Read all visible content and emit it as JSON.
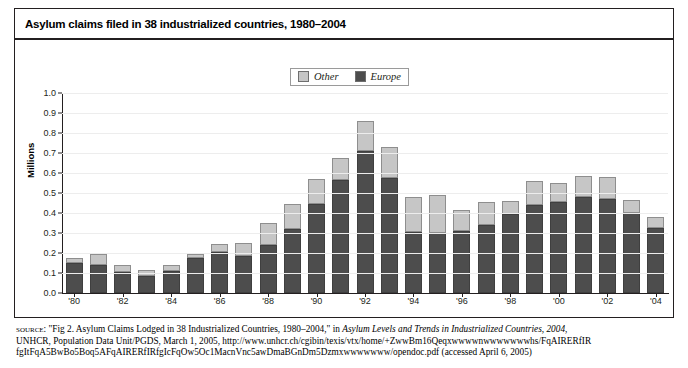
{
  "figure": {
    "title": "Asylum claims filed in 38 industrialized countries, 1980–2004"
  },
  "legend": {
    "position": "top-center",
    "items": [
      {
        "label": "Other",
        "color": "#c6c6c6"
      },
      {
        "label": "Europe",
        "color": "#4d4d4d"
      }
    ]
  },
  "axes": {
    "ylabel": "Millions",
    "yticks": [
      "0.0",
      "0.1",
      "0.2",
      "0.3",
      "0.4",
      "0.5",
      "0.6",
      "0.7",
      "0.8",
      "0.9",
      "1.0"
    ],
    "xticks": [
      "'80",
      "'82",
      "'84",
      "'86",
      "'88",
      "'90",
      "'92",
      "'94",
      "'96",
      "'98",
      "'00",
      "'02",
      "'04"
    ]
  },
  "source": {
    "label": "source:",
    "line1_pre": " \"Fig 2. Asylum Claims Lodged in 38 Industrialized Countries, 1980–2004,\" in ",
    "line1_ital": "Asylum Levels and Trends in Industrialized Countries, 2004",
    "line1_post": ",",
    "line2": "UNHCR, Population Data Unit/PGDS, March 1, 2005, http://www.unhcr.ch/cgibin/texis/vtx/home/+ZwwBm16Qeqxwwwwnwwwwwwwhs/FqAIRERfIR",
    "line3": "fgItFqA5BwBo5Boq5AFqAIRERfIRfgIcFqOw5Oc1MacnVnc5awDmaBGnDm5Dzmxwwwwwww/opendoc.pdf (accessed April 6, 2005)"
  },
  "chart_data": {
    "type": "bar",
    "subtype": "stacked",
    "title": "Asylum claims filed in 38 industrialized countries, 1980–2004",
    "xlabel": "",
    "ylabel": "Millions",
    "ylim": [
      0.0,
      1.0
    ],
    "ystep": 0.1,
    "grid": true,
    "legend_position": "top-center",
    "categories": [
      "1980",
      "1981",
      "1982",
      "1983",
      "1984",
      "1985",
      "1986",
      "1987",
      "1988",
      "1989",
      "1990",
      "1991",
      "1992",
      "1993",
      "1994",
      "1995",
      "1996",
      "1997",
      "1998",
      "1999",
      "2000",
      "2001",
      "2002",
      "2003",
      "2004"
    ],
    "tick_labels": [
      "'80",
      "",
      "'82",
      "",
      "'84",
      "",
      "'86",
      "",
      "'88",
      "",
      "'90",
      "",
      "'92",
      "",
      "'94",
      "",
      "'96",
      "",
      "'98",
      "",
      "'00",
      "",
      "'02",
      "",
      "'04"
    ],
    "series": [
      {
        "name": "Europe",
        "color": "#4d4d4d",
        "values": [
          0.152,
          0.139,
          0.104,
          0.086,
          0.109,
          0.173,
          0.204,
          0.185,
          0.24,
          0.322,
          0.447,
          0.566,
          0.71,
          0.575,
          0.304,
          0.298,
          0.311,
          0.342,
          0.393,
          0.441,
          0.454,
          0.482,
          0.472,
          0.4,
          0.325
        ]
      },
      {
        "name": "Other",
        "color": "#c6c6c6",
        "values": [
          0.023,
          0.056,
          0.035,
          0.029,
          0.032,
          0.021,
          0.042,
          0.065,
          0.108,
          0.122,
          0.125,
          0.11,
          0.15,
          0.155,
          0.178,
          0.19,
          0.105,
          0.115,
          0.065,
          0.118,
          0.097,
          0.103,
          0.11,
          0.067,
          0.055
        ]
      }
    ],
    "totals": [
      0.175,
      0.195,
      0.139,
      0.115,
      0.141,
      0.194,
      0.246,
      0.25,
      0.348,
      0.444,
      0.572,
      0.676,
      0.86,
      0.73,
      0.482,
      0.488,
      0.416,
      0.457,
      0.458,
      0.559,
      0.551,
      0.585,
      0.582,
      0.467,
      0.38
    ]
  }
}
